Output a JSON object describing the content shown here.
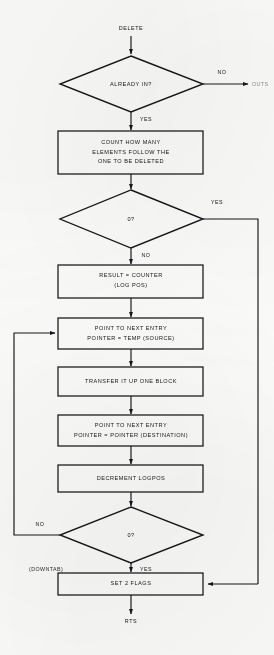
{
  "diagram": {
    "ink_color": "#16161a",
    "paper_color": "#fbfbf9"
  },
  "terminals": {
    "start": "DELETE",
    "end": "RTS",
    "exit_right": "OUTS"
  },
  "nodes": {
    "decision_already_in": "ALREADY IN?",
    "process_count": {
      "line1": "COUNT HOW MANY",
      "line2": "ELEMENTS FOLLOW THE",
      "line3": "ONE TO BE DELETED"
    },
    "decision_zero_top": "0?",
    "process_result": {
      "line1": "RESULT = COUNTER",
      "line2": "(LOG POS)"
    },
    "process_point_source": {
      "line1": "POINT TO NEXT ENTRY",
      "line2": "POINTER = TEMP (SOURCE)"
    },
    "process_transfer": "TRANSFER IT UP ONE BLOCK",
    "process_point_dest": {
      "line1": "POINT TO NEXT ENTRY",
      "line2": "POINTER = POINTER (DESTINATION)"
    },
    "process_decrement": "DECREMENT LOGPOS",
    "decision_zero_bottom": "0?",
    "process_set_flags": "SET 2 FLAGS"
  },
  "edge_labels": {
    "already_in_no": "NO",
    "already_in_yes": "YES",
    "zero_top_yes": "YES",
    "zero_top_no": "NO",
    "zero_bottom_no": "NO",
    "zero_bottom_yes": "YES",
    "downtab": "(DOWNTAB)"
  }
}
